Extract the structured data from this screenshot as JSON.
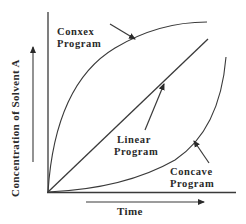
{
  "diagram": {
    "title": "",
    "x_axis_label": "Time",
    "y_axis_label": "Concentration of Solvent A",
    "curves": [
      {
        "name": "Conxex Program",
        "label_line1": "Conxex",
        "label_line2": "Program",
        "shape": "convex"
      },
      {
        "name": "Linear Program",
        "label_line1": "Linear",
        "label_line2": "Program",
        "shape": "linear"
      },
      {
        "name": "Concave Program",
        "label_line1": "Concave",
        "label_line2": "Program",
        "shape": "concave"
      }
    ],
    "line_color": "#3a3a3a",
    "text_color": "#2a2a2a",
    "background": "#ffffff"
  }
}
